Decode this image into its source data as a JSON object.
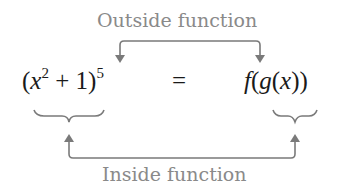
{
  "labels": {
    "outside": "Outside function",
    "inside": "Inside function"
  },
  "expression": {
    "left_open": "(",
    "left_var": "x",
    "left_exp": "2",
    "left_mid": " + 1)",
    "left_power": "5",
    "equals": "=",
    "right_f": "f",
    "right_open1": "(",
    "right_g": "g",
    "right_open2": "(",
    "right_x": "x",
    "right_close": "))"
  },
  "colors": {
    "annotation": "#8a8a8a",
    "arrow": "#7a7a7a",
    "math": "#1a1a1a"
  }
}
